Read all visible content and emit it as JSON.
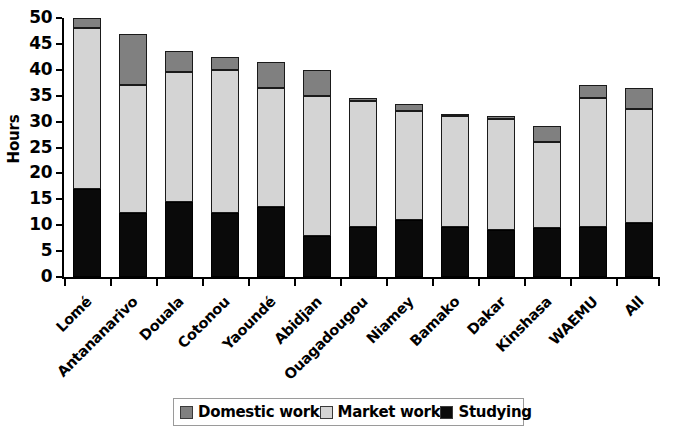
{
  "chart_data": {
    "type": "bar",
    "subtype": "stacked-bar",
    "title": "",
    "xlabel": "",
    "ylabel": "Hours",
    "ylim": [
      0,
      50
    ],
    "ytick_step": 5,
    "yticks": [
      0,
      5,
      10,
      15,
      20,
      25,
      30,
      35,
      40,
      45,
      50
    ],
    "grid": false,
    "legend_position": "bottom",
    "categories": [
      "Lomé",
      "Antananarivo",
      "Douala",
      "Cotonou",
      "Yaoundé",
      "Abidjan",
      "Ouagadougou",
      "Niamey",
      "Bamako",
      "Dakar",
      "Kinshasa",
      "WAEMU",
      "All"
    ],
    "series": [
      {
        "name": "Studying",
        "color": "#0a0a0a",
        "values": [
          17.0,
          12.3,
          14.4,
          12.3,
          13.5,
          8.0,
          9.7,
          11.0,
          9.6,
          9.1,
          9.4,
          9.7,
          10.4
        ]
      },
      {
        "name": "Market work",
        "color": "#d4d4d4",
        "values": [
          31.0,
          24.7,
          25.1,
          27.7,
          23.0,
          27.0,
          24.2,
          21.0,
          21.5,
          21.4,
          16.6,
          24.8,
          22.1
        ]
      },
      {
        "name": "Domestic work",
        "color": "#808080",
        "values": [
          2.0,
          10.0,
          4.1,
          2.5,
          5.0,
          5.0,
          0.6,
          1.4,
          0.4,
          0.5,
          3.2,
          2.5,
          4.0
        ]
      }
    ],
    "totals": [
      50.0,
      47.0,
      43.6,
      42.5,
      41.5,
      40.0,
      34.5,
      33.4,
      31.5,
      31.0,
      29.2,
      37.0,
      36.5
    ]
  },
  "legend": {
    "items": [
      {
        "label": "Domestic work",
        "color": "#808080"
      },
      {
        "label": "Market work",
        "color": "#d4d4d4"
      },
      {
        "label": "Studying",
        "color": "#0a0a0a"
      }
    ]
  }
}
